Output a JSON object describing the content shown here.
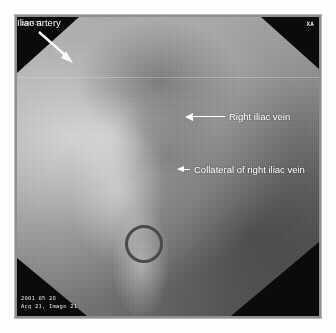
{
  "figure": {
    "modality": "digital subtraction venography",
    "border_color": "#b9b9b9",
    "background_color": "#ffffff"
  },
  "overlay": {
    "patient_id": "290431",
    "view_marker": "XA",
    "study_date": "2001 05 28",
    "acquisition_info": "Acq 21, Image 21"
  },
  "annotations": [
    {
      "id": "right-iliac-vein",
      "label": "Right iliac vein",
      "arrow": "arrow-left-icon",
      "color": "#ffffff"
    },
    {
      "id": "collateral-of-right-iliac-vein",
      "label": "Collateral of right iliac vein",
      "arrow": "arrow-left-short-icon",
      "color": "#ffffff"
    },
    {
      "id": "iliac-artery",
      "label": "Iliac artery",
      "arrow": "arrow-diagonal-down-right-icon",
      "color": "#ffffff"
    }
  ],
  "markers": [
    {
      "id": "vessel-ring",
      "shape": "circle-outline",
      "color": "#4a4a4a"
    }
  ]
}
